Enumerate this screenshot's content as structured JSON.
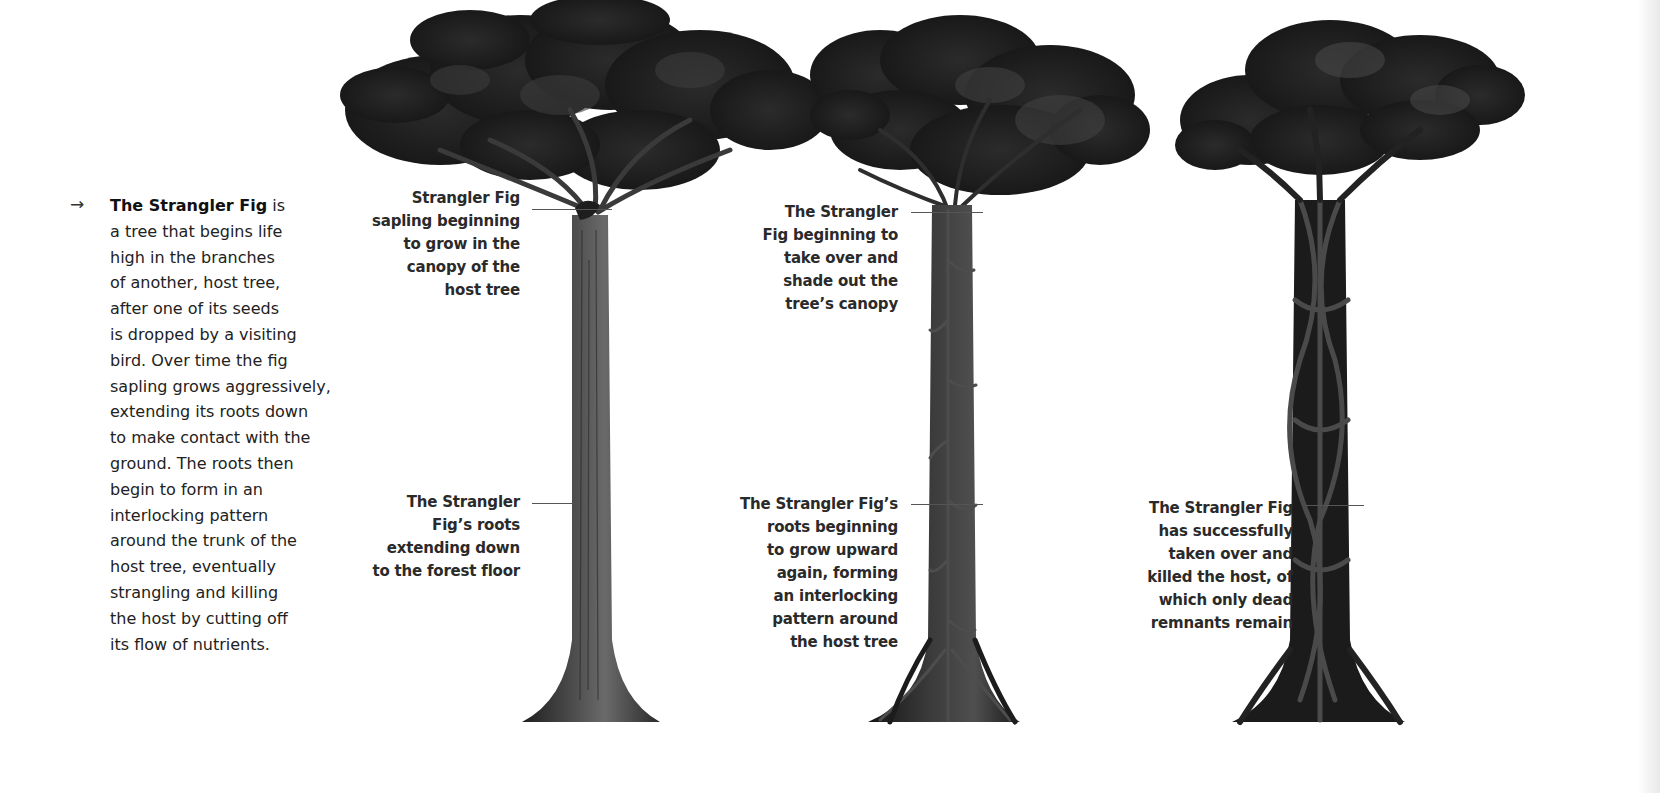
{
  "intro": {
    "arrow_glyph": "→",
    "title": "The Strangler Fig",
    "title_suffix": " is",
    "lines": [
      "a tree that begins life",
      "high in the branches",
      "of another, host tree,",
      "after one of its seeds",
      "is dropped by a visiting",
      "bird. Over time the fig",
      "sapling grows aggressively,",
      "extending its roots down",
      "to make contact with the",
      "ground. The roots then",
      "begin to form in an",
      "interlocking pattern",
      "around the trunk of the",
      "host tree, eventually",
      "strangling and killing",
      "the host by cutting off",
      "its flow of nutrients."
    ]
  },
  "stages": [
    {
      "name": "stage-1",
      "labels": [
        {
          "lines": [
            "Strangler Fig",
            "sapling beginning",
            "to grow in the",
            "canopy of the",
            "host tree"
          ]
        },
        {
          "lines": [
            "The Strangler",
            "Fig’s roots",
            "extending down",
            "to the forest floor"
          ]
        }
      ]
    },
    {
      "name": "stage-2",
      "labels": [
        {
          "lines": [
            "The Strangler",
            "Fig beginning to",
            "take over and",
            "shade out the",
            "tree’s canopy"
          ]
        },
        {
          "lines": [
            "The Strangler Fig’s",
            "roots beginning",
            "to grow upward",
            "again, forming",
            "an interlocking",
            "pattern around",
            "the host tree"
          ]
        }
      ]
    },
    {
      "name": "stage-3",
      "labels": [
        {
          "lines": [
            "The Strangler Fig",
            "has successfully",
            "taken over and",
            "killed the host, of",
            "which only dead",
            "remnants remain"
          ]
        }
      ]
    }
  ],
  "colors": {
    "text": "#222222",
    "leader_line": "#555555",
    "foliage_dark": "#1c1c1c",
    "foliage_mid": "#3a3a3a",
    "trunk": "#3b3b3b",
    "root": "#262626"
  }
}
